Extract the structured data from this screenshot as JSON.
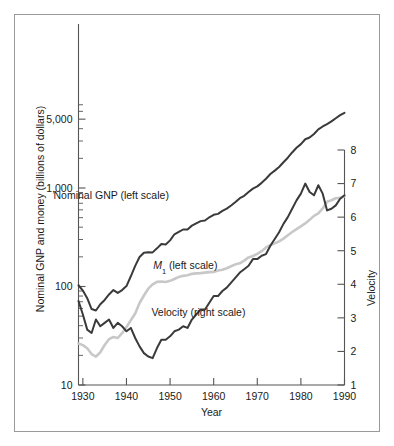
{
  "figure": {
    "border_color": "#9a9a9a",
    "background": "#ffffff"
  },
  "chart_data": {
    "type": "line",
    "title": "",
    "xlabel": "Year",
    "ylabel": "Nominal GNP and money (billions of dollars)",
    "y2label": "Velocity",
    "xlim": [
      1929,
      1990
    ],
    "ylim": [
      10,
      8000
    ],
    "y2lim": [
      1,
      8
    ],
    "yscale": "log",
    "y2scale": "linear",
    "grid": false,
    "legend_position": "inline-annotations",
    "xticks": [
      1930,
      1940,
      1950,
      1960,
      1970,
      1980,
      1990
    ],
    "xticklabels": [
      "1930",
      "1940",
      "1950",
      "1960",
      "1970",
      "1980",
      "1990"
    ],
    "yticks": [
      10,
      100,
      1000,
      5000
    ],
    "yticklabels": [
      "10",
      "100",
      "1,000",
      "5,000"
    ],
    "y2ticks": [
      1,
      2,
      3,
      4,
      5,
      6,
      7,
      8
    ],
    "y2ticklabels": [
      "1",
      "2",
      "3",
      "4",
      "5",
      "6",
      "7",
      "8"
    ],
    "annotations": [
      {
        "text": "Nominal GNP (left scale)",
        "x": 1936.5,
        "y": 780,
        "name": "gnp-label"
      },
      {
        "text": "M₁ (left scale)",
        "x": 1953.5,
        "y": 152,
        "name": "m1-label"
      },
      {
        "text": "Velocity (right scale)",
        "x": 1956.5,
        "y": 60,
        "name": "velocity-label"
      }
    ],
    "series": [
      {
        "name": "Nominal GNP (left scale)",
        "axis": "left",
        "color": "#3a3a3a",
        "width": 2.0,
        "x": [
          1929,
          1930,
          1931,
          1932,
          1933,
          1934,
          1935,
          1936,
          1937,
          1938,
          1939,
          1940,
          1941,
          1942,
          1943,
          1944,
          1945,
          1946,
          1947,
          1948,
          1949,
          1950,
          1951,
          1952,
          1953,
          1954,
          1955,
          1956,
          1957,
          1958,
          1959,
          1960,
          1961,
          1962,
          1963,
          1964,
          1965,
          1966,
          1967,
          1968,
          1969,
          1970,
          1971,
          1972,
          1973,
          1974,
          1975,
          1976,
          1977,
          1978,
          1979,
          1980,
          1981,
          1982,
          1983,
          1984,
          1985,
          1986,
          1987,
          1988,
          1989,
          1990
        ],
        "values": [
          103,
          91,
          76,
          59,
          57,
          66,
          73,
          83,
          92,
          86,
          92,
          101,
          127,
          162,
          199,
          220,
          223,
          222,
          244,
          270,
          267,
          294,
          339,
          358,
          379,
          380,
          415,
          438,
          461,
          468,
          504,
          534,
          546,
          586,
          618,
          664,
          720,
          788,
          833,
          910,
          985,
          1039,
          1128,
          1240,
          1386,
          1501,
          1635,
          1824,
          2030,
          2294,
          2563,
          2788,
          3126,
          3253,
          3535,
          3933,
          4213,
          4453,
          4743,
          5108,
          5489,
          5803
        ]
      },
      {
        "name": "M1 (left scale)",
        "axis": "left",
        "color": "#c8c8c8",
        "width": 2.6,
        "x": [
          1929,
          1930,
          1931,
          1932,
          1933,
          1934,
          1935,
          1936,
          1937,
          1938,
          1939,
          1940,
          1941,
          1942,
          1943,
          1944,
          1945,
          1946,
          1947,
          1948,
          1949,
          1950,
          1951,
          1952,
          1953,
          1954,
          1955,
          1956,
          1957,
          1958,
          1959,
          1960,
          1961,
          1962,
          1963,
          1964,
          1965,
          1966,
          1967,
          1968,
          1969,
          1970,
          1971,
          1972,
          1973,
          1974,
          1975,
          1976,
          1977,
          1978,
          1979,
          1980,
          1981,
          1982,
          1983,
          1984,
          1985,
          1986,
          1987,
          1988,
          1989,
          1990
        ],
        "values": [
          26.4,
          25.4,
          23.6,
          20.6,
          19.4,
          21.5,
          25.5,
          29.2,
          30.7,
          30.0,
          33.6,
          38.7,
          45.5,
          53.2,
          68.0,
          81.0,
          95.0,
          105.0,
          111.5,
          112.3,
          111.2,
          114.1,
          119.2,
          125.2,
          128.3,
          130.3,
          134.4,
          136.0,
          136.7,
          138.4,
          140.0,
          140.7,
          145.2,
          147.8,
          153.3,
          160.3,
          167.8,
          172.0,
          183.3,
          197.4,
          203.9,
          214.4,
          228.3,
          249.2,
          262.8,
          274.3,
          287.5,
          306.3,
          330.9,
          357.3,
          381.8,
          408.5,
          436.7,
          474.8,
          521.4,
          552.0,
          620.0,
          724.7,
          750.2,
          787.0,
          794.1,
          826.1
        ]
      },
      {
        "name": "Velocity (right scale)",
        "axis": "right",
        "color": "#3a3a3a",
        "width": 2.0,
        "x": [
          1929,
          1930,
          1931,
          1932,
          1933,
          1934,
          1935,
          1936,
          1937,
          1938,
          1939,
          1940,
          1941,
          1942,
          1943,
          1944,
          1945,
          1946,
          1947,
          1948,
          1949,
          1950,
          1951,
          1952,
          1953,
          1954,
          1955,
          1956,
          1957,
          1958,
          1959,
          1960,
          1961,
          1962,
          1963,
          1964,
          1965,
          1966,
          1967,
          1968,
          1969,
          1970,
          1971,
          1972,
          1973,
          1974,
          1975,
          1976,
          1977,
          1978,
          1979,
          1980,
          1981,
          1982,
          1983,
          1984,
          1985,
          1986,
          1987,
          1988,
          1989,
          1990
        ],
        "values": [
          3.5,
          3.1,
          2.65,
          2.55,
          2.95,
          2.75,
          2.85,
          2.95,
          2.7,
          2.85,
          2.75,
          2.6,
          2.7,
          2.4,
          2.15,
          1.95,
          1.85,
          1.8,
          2.1,
          2.35,
          2.35,
          2.45,
          2.6,
          2.65,
          2.75,
          2.7,
          2.95,
          3.1,
          3.25,
          3.25,
          3.45,
          3.65,
          3.65,
          3.8,
          3.9,
          4.05,
          4.2,
          4.35,
          4.45,
          4.55,
          4.75,
          4.75,
          4.85,
          4.9,
          5.15,
          5.35,
          5.55,
          5.8,
          6.0,
          6.25,
          6.5,
          6.7,
          7.0,
          6.75,
          6.65,
          6.95,
          6.7,
          6.2,
          6.25,
          6.35,
          6.55,
          6.65
        ]
      }
    ]
  }
}
